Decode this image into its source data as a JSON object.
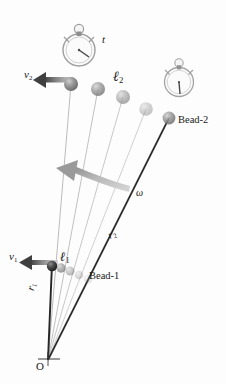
{
  "figure": {
    "type": "physics-diagram",
    "background_color": "#fdfdfd",
    "ink_color": "#1a1a1a",
    "accent_gray": "#9a9a9a"
  },
  "labels": {
    "origin": "O",
    "v1": {
      "symbol": "v",
      "sub": "1"
    },
    "v2": {
      "symbol": "v",
      "sub": "2"
    },
    "l1": {
      "symbol": "ℓ",
      "sub": "1"
    },
    "l2": {
      "symbol": "ℓ",
      "sub": "2"
    },
    "r1": {
      "symbol": "r",
      "sub": "1"
    },
    "r2": {
      "symbol": "r",
      "sub": "2"
    },
    "omega": "ω",
    "time": "t",
    "bead1": "Bead-1",
    "bead2": "Bead-2"
  },
  "geometry": {
    "origin": {
      "x": 48,
      "y": 360
    },
    "rays": [
      {
        "name": "ray-r1-leftmost",
        "angle_deg": -99.5,
        "weight": "bold",
        "color": "#2a2a2a"
      },
      {
        "name": "ray-2",
        "angle_deg": -92.0,
        "weight": "thin",
        "color": "#8d8d8d"
      },
      {
        "name": "ray-3",
        "angle_deg": -85.0,
        "weight": "thin",
        "color": "#9a9a9a"
      },
      {
        "name": "ray-4",
        "angle_deg": -78.0,
        "weight": "thin",
        "color": "#a5a5a5"
      },
      {
        "name": "ray-5",
        "angle_deg": -71.5,
        "weight": "thin",
        "color": "#b0b0b0"
      },
      {
        "name": "ray-r2-rightmost",
        "angle_deg": -64.5,
        "weight": "bold",
        "color": "#2a2a2a"
      }
    ],
    "outer_beads": [
      {
        "x": 71,
        "y": 84,
        "radius": 7.0,
        "opacity": 1.0
      },
      {
        "x": 97,
        "y": 88,
        "radius": 7.0,
        "opacity": 0.8
      },
      {
        "x": 122,
        "y": 96,
        "radius": 7.0,
        "opacity": 0.6
      },
      {
        "x": 145,
        "y": 108,
        "radius": 7.0,
        "opacity": 0.42
      },
      {
        "x": 168,
        "y": 120,
        "radius": 6.5,
        "opacity": 0.88
      }
    ],
    "inner_beads": [
      {
        "x": 52,
        "y": 266,
        "radius": 5.0,
        "opacity": 1.0
      },
      {
        "x": 61,
        "y": 268,
        "radius": 4.6,
        "opacity": 0.72
      },
      {
        "x": 70,
        "y": 271,
        "radius": 4.4,
        "opacity": 0.5
      },
      {
        "x": 79,
        "y": 275,
        "radius": 4.2,
        "opacity": 0.34
      },
      {
        "x": 88,
        "y": 279,
        "radius": 4.2,
        "opacity": 0.22
      }
    ],
    "velocity_arrows": [
      {
        "name": "v2-arrow",
        "x1": 70,
        "y1": 84,
        "x2": 34,
        "y2": 80
      },
      {
        "name": "v1-arrow",
        "x1": 56,
        "y1": 266,
        "x2": 20,
        "y2": 262
      }
    ],
    "omega_arrow": {
      "from_x": 127,
      "from_y": 190,
      "to_x": 63,
      "to_y": 170
    }
  },
  "stopwatches": [
    {
      "name": "stopwatch-early",
      "cx": 79,
      "cy": 50,
      "r": 16,
      "hand_angle_deg": 35,
      "label": "t"
    },
    {
      "name": "stopwatch-late",
      "cx": 179,
      "cy": 82,
      "r": 14,
      "hand_angle_deg": 88,
      "label": ""
    }
  ],
  "label_positions": {
    "v2": {
      "left": 24,
      "top": 70
    },
    "t": {
      "left": 102,
      "top": 36
    },
    "l2": {
      "left": 113,
      "top": 71
    },
    "bead2": {
      "left": 178,
      "top": 116
    },
    "omega": {
      "left": 136,
      "top": 189
    },
    "r2": {
      "left": 106,
      "top": 232
    },
    "v1": {
      "left": 9,
      "top": 252
    },
    "l1": {
      "left": 60,
      "top": 251
    },
    "bead1": {
      "left": 89,
      "top": 272
    },
    "r1": {
      "left": 25,
      "top": 290
    },
    "origin": {
      "left": 37,
      "top": 362
    }
  }
}
